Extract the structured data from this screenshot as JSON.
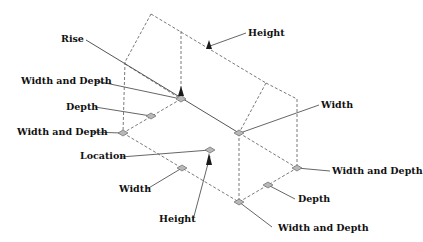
{
  "diagram": {
    "colors": {
      "background": "#ffffff",
      "dashed_edge": "#6a6a6a",
      "leader_line": "#555555",
      "grip_fill": "#b8b8b8",
      "grip_stroke": "#6a6a6a",
      "arrow_fill": "#1a1a1a",
      "text": "#111111"
    },
    "labels": {
      "rise": "Rise",
      "height_top": "Height",
      "width_and_depth_upper_left": "Width and Depth",
      "depth_left": "Depth",
      "width_and_depth_left": "Width and Depth",
      "width_right": "Width",
      "location": "Location",
      "width_bottom_left": "Width",
      "height_bottom": "Height",
      "width_and_depth_right": "Width and Depth",
      "depth_right": "Depth",
      "width_and_depth_bottom": "Width and Depth"
    }
  }
}
